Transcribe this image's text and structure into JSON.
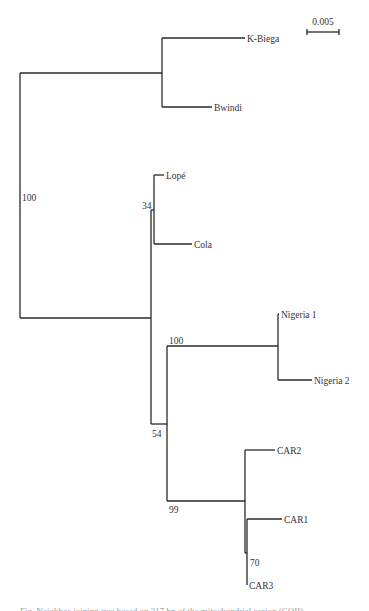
{
  "figure": {
    "type": "phylogenetic-tree",
    "scale_bar": {
      "label": "0.005",
      "x1": 307,
      "x2": 339,
      "y": 32
    },
    "taxa": [
      {
        "id": "k-biega",
        "label": "K-Biega",
        "x": 245,
        "y": 38
      },
      {
        "id": "bwindi",
        "label": "Bwindi",
        "x": 212,
        "y": 107
      },
      {
        "id": "lope",
        "label": "Lopé",
        "x": 164,
        "y": 175
      },
      {
        "id": "cola",
        "label": "Cola",
        "x": 192,
        "y": 244
      },
      {
        "id": "nigeria-1",
        "label": "Nigeria 1",
        "x": 279,
        "y": 314
      },
      {
        "id": "nigeria-2",
        "label": "Nigeria 2",
        "x": 312,
        "y": 380
      },
      {
        "id": "car2",
        "label": "CAR2",
        "x": 275,
        "y": 450
      },
      {
        "id": "car1",
        "label": "CAR1",
        "x": 282,
        "y": 519
      },
      {
        "id": "car3",
        "label": "CAR3",
        "x": 247,
        "y": 585
      }
    ],
    "bootstrap_values": [
      {
        "node": "root",
        "label": "100",
        "x": 22,
        "y": 201
      },
      {
        "node": "lope-cola",
        "label": "34",
        "x": 142,
        "y": 209
      },
      {
        "node": "nigeria",
        "label": "100",
        "x": 169,
        "y": 344
      },
      {
        "node": "western-central",
        "label": "54",
        "x": 152,
        "y": 437
      },
      {
        "node": "car",
        "label": "99",
        "x": 169,
        "y": 513
      },
      {
        "node": "car1-car3",
        "label": "70",
        "x": 250,
        "y": 566
      }
    ],
    "branches": [
      {
        "x1": 20,
        "y1": 73,
        "x2": 20,
        "y2": 318
      },
      {
        "x1": 20,
        "y1": 73,
        "x2": 162,
        "y2": 73
      },
      {
        "x1": 162,
        "y1": 38,
        "x2": 162,
        "y2": 107
      },
      {
        "x1": 162,
        "y1": 38,
        "x2": 245,
        "y2": 38
      },
      {
        "x1": 162,
        "y1": 107,
        "x2": 212,
        "y2": 107
      },
      {
        "x1": 20,
        "y1": 318,
        "x2": 151,
        "y2": 318
      },
      {
        "x1": 151,
        "y1": 210,
        "x2": 151,
        "y2": 424
      },
      {
        "x1": 151,
        "y1": 210,
        "x2": 154,
        "y2": 210
      },
      {
        "x1": 154,
        "y1": 175,
        "x2": 154,
        "y2": 244
      },
      {
        "x1": 154,
        "y1": 175,
        "x2": 164,
        "y2": 175
      },
      {
        "x1": 154,
        "y1": 244,
        "x2": 192,
        "y2": 244
      },
      {
        "x1": 151,
        "y1": 424,
        "x2": 167,
        "y2": 424
      },
      {
        "x1": 167,
        "y1": 346,
        "x2": 167,
        "y2": 501
      },
      {
        "x1": 167,
        "y1": 346,
        "x2": 278,
        "y2": 346
      },
      {
        "x1": 278,
        "y1": 314,
        "x2": 278,
        "y2": 380
      },
      {
        "x1": 278,
        "y1": 314,
        "x2": 279,
        "y2": 314
      },
      {
        "x1": 278,
        "y1": 380,
        "x2": 312,
        "y2": 380
      },
      {
        "x1": 167,
        "y1": 501,
        "x2": 245,
        "y2": 501
      },
      {
        "x1": 245,
        "y1": 450,
        "x2": 245,
        "y2": 553
      },
      {
        "x1": 245,
        "y1": 450,
        "x2": 275,
        "y2": 450
      },
      {
        "x1": 245,
        "y1": 553,
        "x2": 247,
        "y2": 553
      },
      {
        "x1": 247,
        "y1": 519,
        "x2": 247,
        "y2": 585
      },
      {
        "x1": 247,
        "y1": 519,
        "x2": 282,
        "y2": 519
      }
    ]
  },
  "caption": "Fig. Neighbor-joining tree based on 317 bp of the mitochondrial region (COII)"
}
